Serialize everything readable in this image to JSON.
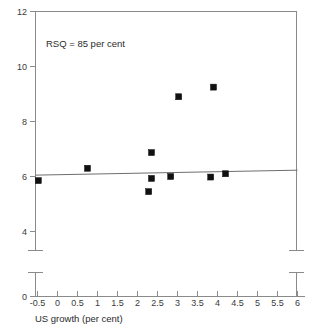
{
  "chart_data": {
    "type": "scatter",
    "title": "",
    "xlabel": "US growth (per cent)",
    "ylabel": "",
    "xlim": [
      -0.75,
      6.0
    ],
    "ylim": [
      0,
      12
    ],
    "grid": false,
    "legend": null,
    "annotations": [
      {
        "text": "RSQ = 85 per cent",
        "x": 0.1,
        "y": 11.0
      }
    ],
    "y_axis_break": {
      "between": [
        4,
        0
      ],
      "style": "double-cap"
    },
    "xticks": [
      -0.5,
      0,
      0.5,
      1,
      1.5,
      2,
      2.5,
      3,
      3.5,
      4,
      4.5,
      5,
      5.5,
      6
    ],
    "xtick_labels": [
      "-0.5",
      "0",
      "0.5",
      "1",
      "1.5",
      "2",
      "2.5",
      "3",
      "3.5",
      "4",
      "4.5",
      "5",
      "5.5",
      "6"
    ],
    "yticks": [
      12,
      10,
      8,
      6,
      4,
      0
    ],
    "ytick_labels": [
      "12",
      "10",
      "8",
      "6",
      "4",
      "0"
    ],
    "series": [
      {
        "name": "observations",
        "marker": "filled-square",
        "color": "#111111",
        "points": [
          {
            "x": -0.48,
            "y": 5.85
          },
          {
            "x": 0.75,
            "y": 6.3
          },
          {
            "x": 2.28,
            "y": 5.45
          },
          {
            "x": 2.35,
            "y": 5.93
          },
          {
            "x": 2.35,
            "y": 6.87
          },
          {
            "x": 2.83,
            "y": 6.0
          },
          {
            "x": 3.03,
            "y": 8.9
          },
          {
            "x": 3.83,
            "y": 5.98
          },
          {
            "x": 3.9,
            "y": 9.25
          },
          {
            "x": 4.2,
            "y": 6.1
          }
        ]
      }
    ],
    "trendline": {
      "name": "fitted-regression-line",
      "color": "#6e6e6e",
      "x_start": -0.55,
      "y_start": 6.05,
      "x_end": 6.0,
      "y_end": 6.23
    }
  },
  "axes": {
    "x_title": "US growth (per cent)",
    "annotation": "RSQ = 85 per cent"
  }
}
